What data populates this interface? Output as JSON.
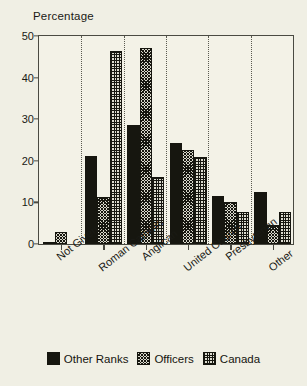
{
  "chart_data": {
    "type": "bar",
    "title": "Percentage",
    "xlabel": "",
    "ylabel": "Percentage",
    "ylim": [
      0,
      50
    ],
    "yticks": [
      0,
      10,
      20,
      30,
      40,
      50
    ],
    "grid": false,
    "legend_position": "bottom",
    "categories": [
      "Not Given",
      "Roman Catholic",
      "Anglican",
      "United Church",
      "Presbyterian",
      "Other"
    ],
    "series": [
      {
        "name": "Other Ranks",
        "pattern": "solid",
        "color": "#16160f",
        "values": [
          0.5,
          21.2,
          28.5,
          24.2,
          11.5,
          12.6
        ]
      },
      {
        "name": "Officers",
        "pattern": "diagonal-hatch",
        "color": "#d9d8cc",
        "values": [
          2.9,
          11.2,
          47.0,
          22.6,
          10.1,
          4.6
        ]
      },
      {
        "name": "Canada",
        "pattern": "grid-hatch",
        "color": "#dddcd0",
        "values": [
          0,
          46.5,
          16.2,
          20.8,
          7.6,
          7.6
        ]
      }
    ]
  },
  "legend": {
    "items": [
      {
        "label": "Other Ranks",
        "pattern": "solid"
      },
      {
        "label": "Officers",
        "pattern": "diagonal-hatch"
      },
      {
        "label": "Canada",
        "pattern": "grid-hatch"
      }
    ]
  }
}
